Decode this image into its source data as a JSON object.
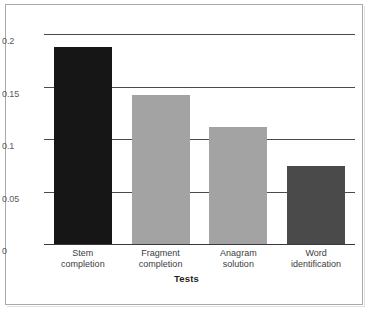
{
  "chart_data": {
    "type": "bar",
    "title": "",
    "subtitle": "",
    "xlabel": "Tests",
    "ylabel": "Percentage improvement over control",
    "categories": [
      "Stem\ncompletion",
      "Fragment\ncompletion",
      "Anagram\nsolution",
      "Word\nidentification"
    ],
    "values": [
      0.188,
      0.142,
      0.111,
      0.074
    ],
    "bar_colors": [
      "#161616",
      "#a3a3a3",
      "#a3a3a3",
      "#4a4a4a"
    ],
    "ylim": [
      0,
      0.2
    ],
    "yticks": [
      0,
      0.05,
      0.1,
      0.15,
      0.2
    ],
    "ytick_labels": [
      "0",
      "0.05",
      "0.1",
      "0.15",
      "0.2"
    ],
    "grid": true,
    "legend": false,
    "legend_position": "none"
  },
  "axes": {
    "y_title": "Percentage improvement over control",
    "x_title": "Tests"
  },
  "colors": {
    "grid": "#4b4b4f",
    "axis": "#3a3a3e",
    "frame": "#a9a9ae",
    "background": "#ffffff",
    "tick_text": "#58585c",
    "label_text": "#3c3c40"
  }
}
